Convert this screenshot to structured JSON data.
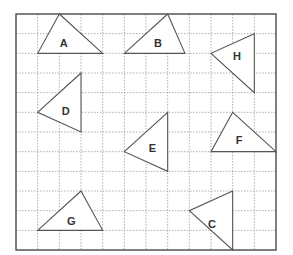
{
  "grid": {
    "left": 16,
    "top": 14,
    "right": 276,
    "bottom": 250,
    "cols": 12,
    "rows": 12,
    "line_color": "#9a9a9a",
    "border_color": "#555555",
    "fill_color": "#ffffff"
  },
  "triangles": [
    {
      "label": "A",
      "vertices": [
        [
          2,
          0
        ],
        [
          1,
          2
        ],
        [
          4,
          2
        ]
      ],
      "label_pos": [
        2.2,
        1.45
      ]
    },
    {
      "label": "B",
      "vertices": [
        [
          7,
          0
        ],
        [
          5,
          2
        ],
        [
          7.8,
          2
        ]
      ],
      "label_pos": [
        6.55,
        1.45
      ]
    },
    {
      "label": "H",
      "vertices": [
        [
          11,
          1
        ],
        [
          9,
          2
        ],
        [
          11,
          4
        ]
      ],
      "label_pos": [
        10.2,
        2.15
      ]
    },
    {
      "label": "D",
      "vertices": [
        [
          3,
          3
        ],
        [
          1,
          5
        ],
        [
          3,
          6
        ]
      ],
      "label_pos": [
        2.3,
        4.95
      ]
    },
    {
      "label": "E",
      "vertices": [
        [
          7,
          5
        ],
        [
          5,
          7
        ],
        [
          7,
          8
        ]
      ],
      "label_pos": [
        6.3,
        6.8
      ]
    },
    {
      "label": "F",
      "vertices": [
        [
          10,
          5
        ],
        [
          9,
          7
        ],
        [
          12,
          7
        ]
      ],
      "label_pos": [
        10.3,
        6.4
      ]
    },
    {
      "label": "G",
      "vertices": [
        [
          3,
          9
        ],
        [
          1,
          11
        ],
        [
          4,
          11
        ]
      ],
      "label_pos": [
        2.55,
        10.55
      ]
    },
    {
      "label": "C",
      "vertices": [
        [
          10,
          9
        ],
        [
          8,
          10
        ],
        [
          10,
          12
        ]
      ],
      "label_pos": [
        9.05,
        10.7
      ]
    }
  ]
}
